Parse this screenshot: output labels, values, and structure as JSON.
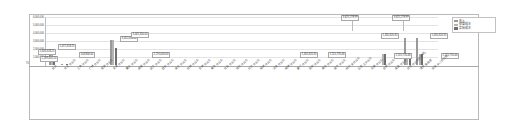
{
  "legend": {
    "position": "right",
    "items": [
      {
        "label": "收入",
        "color": "#9a9a9a",
        "name": "legend-revenue"
      },
      {
        "label": "预算成本",
        "color": "#b4b4b4",
        "name": "legend-budget-cost"
      },
      {
        "label": "实际成本",
        "color": "#6e6e6e",
        "name": "legend-actual-cost"
      }
    ]
  },
  "axes": {
    "zero_label": "¥0",
    "yticks": [
      "6,000,000",
      "5,000,000",
      "4,000,000",
      "3,000,000",
      "2,000,000",
      "1,000,000"
    ]
  },
  "chart_data": {
    "type": "bar",
    "title": "",
    "xlabel": "",
    "ylabel": "",
    "ylim": [
      0,
      6500000
    ],
    "grid": true,
    "legend_position": "right",
    "categories": [
      "合计",
      "北京分公司",
      "上海分公司",
      "广州分公司",
      "深圳分公司",
      "天津分公司",
      "重庆分公司",
      "成都分公司",
      "武汉分公司",
      "西安分公司",
      "南京分公司",
      "杭州分公司",
      "苏州分公司",
      "青岛分公司",
      "大连分公司",
      "沈阳分公司",
      "长沙分公司",
      "郑州分公司",
      "济南分公司",
      "福州分公司",
      "厦门分公司",
      "昆明分公司",
      "贵阳分公司",
      "南宁分公司",
      "哈尔滨分公司",
      "石家庄分公司",
      "太原分公司",
      "合肥分公司",
      "南昌分公司",
      "其他分公司(含总部)",
      "海外事业部",
      "研发中心项目组"
    ],
    "series": [
      {
        "name": "收入",
        "color": "#9a9a9a",
        "values": [
          1626318.25,
          104800.0,
          0,
          0,
          0,
          3452000.0,
          0,
          0,
          0,
          0,
          0,
          0,
          0,
          0,
          0,
          0,
          0,
          0,
          0,
          0,
          0,
          0,
          0,
          0,
          0,
          0,
          0,
          0,
          0,
          3625278.99,
          3625278.99,
          0
        ]
      },
      {
        "name": "预算成本",
        "color": "#b4b4b4",
        "values": [
          1472318.25,
          0,
          0,
          0,
          0,
          3445300.0,
          0,
          0,
          0,
          0,
          0,
          0,
          0,
          0,
          0,
          0,
          0,
          0,
          0,
          0,
          0,
          0,
          0,
          0,
          0,
          0,
          0,
          1450320.35,
          0,
          1450320.35,
          1450320.35,
          0
        ]
      },
      {
        "name": "实际成本",
        "color": "#6e6e6e",
        "values": [
          1269405.5,
          98430.5,
          0,
          0,
          0,
          2270000.0,
          0,
          0,
          0,
          0,
          0,
          0,
          0,
          0,
          0,
          0,
          0,
          0,
          0,
          0,
          0,
          0,
          0,
          0,
          0,
          0,
          0,
          1515735.46,
          0,
          1515735.46,
          1515735.46,
          0
        ]
      }
    ],
    "data_labels": [
      {
        "text": "1,626,318.25",
        "name": "data-label-total-revenue"
      },
      {
        "text": "1,472,318.25",
        "name": "data-label-total-budget"
      },
      {
        "text": "1,269,405.50",
        "name": "data-label-total-actual"
      },
      {
        "text": "104,800.00",
        "name": "data-label-beijing-revenue"
      },
      {
        "text": "3,452,000.00",
        "name": "data-label-tianjin-revenue"
      },
      {
        "text": "3,445,300.00",
        "name": "data-label-tianjin-budget"
      },
      {
        "text": "2,270,000.00",
        "name": "data-label-tianjin-actual"
      },
      {
        "text": "1,450,320.35",
        "name": "data-label-other-budget"
      },
      {
        "text": "1,515,735.46",
        "name": "data-label-other-actual"
      },
      {
        "text": "3,625,278.99",
        "name": "data-label-overseas-revenue"
      },
      {
        "text": "3,625,278.99",
        "name": "data-label-rnd-revenue"
      },
      {
        "text": "1,450,320.35",
        "name": "data-label-overseas-budget"
      },
      {
        "text": "1,515,735.46",
        "name": "data-label-overseas-actual"
      },
      {
        "text": "1,450,320.35",
        "name": "data-label-rnd-budget"
      },
      {
        "text": "1,515,735.46",
        "name": "data-label-rnd-actual"
      }
    ]
  }
}
